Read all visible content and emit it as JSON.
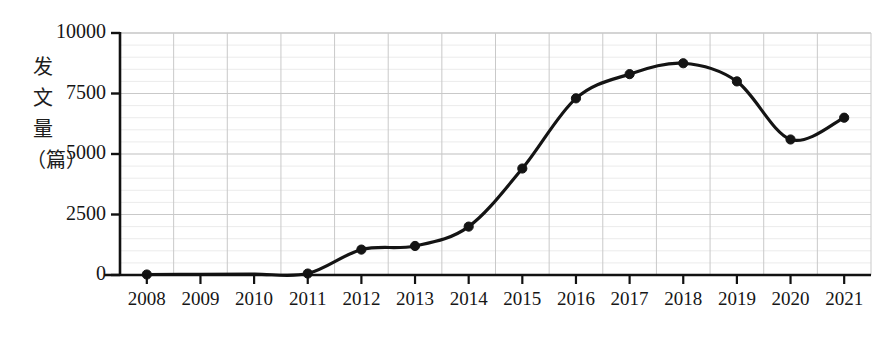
{
  "chart_data": {
    "type": "line",
    "title": "",
    "xlabel": "",
    "ylabel": "发\n文\n量\n（篇）",
    "ylabel_chars": [
      "发",
      "文",
      "量",
      "（篇）"
    ],
    "categories": [
      "2008",
      "2009",
      "2010",
      "2011",
      "2012",
      "2013",
      "2014",
      "2015",
      "2016",
      "2017",
      "2018",
      "2019",
      "2020",
      "2021"
    ],
    "values": [
      20,
      30,
      40,
      60,
      1050,
      1200,
      2000,
      4400,
      7300,
      8300,
      8750,
      8000,
      5600,
      6500
    ],
    "series": [
      {
        "name": "发文量（篇）",
        "values": [
          20,
          30,
          40,
          60,
          1050,
          1200,
          2000,
          4400,
          7300,
          8300,
          8750,
          8000,
          5600,
          6500
        ]
      }
    ],
    "marker_years": [
      "2008",
      "2011",
      "2012",
      "2013",
      "2014",
      "2015",
      "2016",
      "2017",
      "2018",
      "2019",
      "2020",
      "2021"
    ],
    "ylim": [
      0,
      10000
    ],
    "ytick_labels": [
      "0",
      "2500",
      "5000",
      "7500",
      "10000"
    ],
    "ytick_values": [
      0,
      2500,
      5000,
      7500,
      10000
    ],
    "grid": true,
    "grid_minor": true,
    "legend": "none",
    "line_color": "#141414",
    "marker_color": "#141414",
    "grid_color": "#c9c9c9",
    "axis_color": "#111111",
    "background_color": "#ffffff"
  }
}
